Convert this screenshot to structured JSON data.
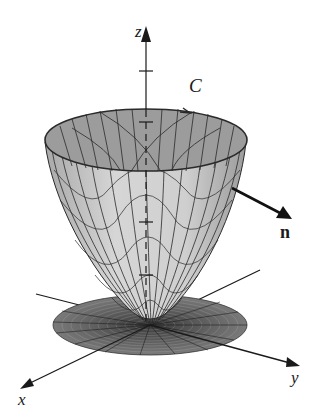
{
  "diagram": {
    "labels": {
      "z_axis": "z",
      "x_axis": "x",
      "y_axis": "y",
      "curve": "C",
      "normal": "n"
    },
    "colors": {
      "surface_outer": "#c8c8c8",
      "surface_inner": "#9a9a9a",
      "mesh_line": "#2a2a2a",
      "disk": "#6e6e6e",
      "axis": "#1a1a1a",
      "background": "#ffffff"
    }
  }
}
